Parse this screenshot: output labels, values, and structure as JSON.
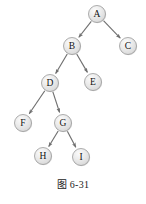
{
  "figure": {
    "caption": "图 6-31",
    "background_color": "#ffffff",
    "node_fill_color": "#e3e3e3",
    "node_highlight_color": "#f4f4f4",
    "node_stroke_color": "#8d8d8d",
    "edge_color": "#6f6f6f",
    "label_color": "#111111",
    "node_radius": 8.5,
    "width": 146,
    "height": 204
  },
  "tree": {
    "type": "binary-tree",
    "root": "A",
    "nodes": [
      {
        "id": "A",
        "label": "A",
        "cx": 97,
        "cy": 14
      },
      {
        "id": "B",
        "label": "B",
        "cx": 72,
        "cy": 46
      },
      {
        "id": "C",
        "label": "C",
        "cx": 128,
        "cy": 46
      },
      {
        "id": "D",
        "label": "D",
        "cx": 50,
        "cy": 83
      },
      {
        "id": "E",
        "label": "E",
        "cx": 93,
        "cy": 82
      },
      {
        "id": "F",
        "label": "F",
        "cx": 23,
        "cy": 123
      },
      {
        "id": "G",
        "label": "G",
        "cx": 63,
        "cy": 123
      },
      {
        "id": "H",
        "label": "H",
        "cx": 43,
        "cy": 156
      },
      {
        "id": "I",
        "label": "I",
        "cx": 81,
        "cy": 157
      }
    ],
    "edges": [
      {
        "from": "A",
        "to": "B",
        "side": "left"
      },
      {
        "from": "A",
        "to": "C",
        "side": "right"
      },
      {
        "from": "B",
        "to": "D",
        "side": "left"
      },
      {
        "from": "B",
        "to": "E",
        "side": "right"
      },
      {
        "from": "D",
        "to": "F",
        "side": "left"
      },
      {
        "from": "D",
        "to": "G",
        "side": "right"
      },
      {
        "from": "G",
        "to": "H",
        "side": "left"
      },
      {
        "from": "G",
        "to": "I",
        "side": "right"
      }
    ]
  }
}
